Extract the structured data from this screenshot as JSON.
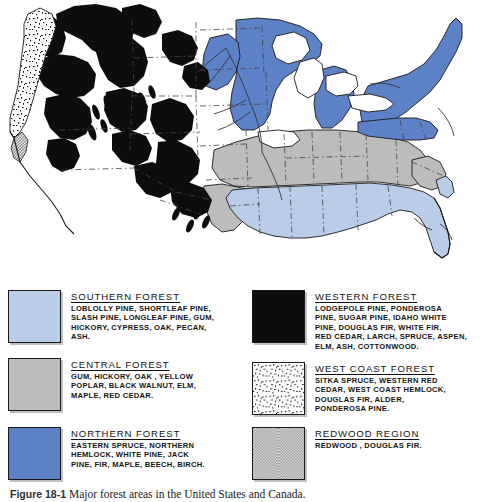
{
  "figure": {
    "caption_label": "Figure 18-1",
    "caption_text": "Major forest areas in the United States and Canada.",
    "alt_title": "Major forest areas in the United States and Canada"
  },
  "colors": {
    "southern_forest": "#b9cde9",
    "central_forest": "#bcbcbc",
    "northern_forest": "#5d81c6",
    "western_forest": "#0d0d0d",
    "west_coast_forest": "#ffffff",
    "redwood_region": "#c2c2c2",
    "outline": "#1a1a1a",
    "background": "#ffffff"
  },
  "legend": {
    "left_column": [
      {
        "key": "southern-forest",
        "title": "SOUTHERN FOREST",
        "swatch": "light-blue-solid",
        "species_lines": [
          "LOBLOLLY PINE, SHORTLEAF PINE,",
          "SLASH PINE, LONGLEAF PINE, GUM,",
          "HICKORY, CYPRESS, OAK, PECAN,",
          "ASH."
        ]
      },
      {
        "key": "central-forest",
        "title": "CENTRAL FOREST",
        "swatch": "gray-solid",
        "species_lines": [
          "GUM, HICKORY, OAK , YELLOW",
          "POPLAR, BLACK WALNUT, ELM,",
          "MAPLE, RED CEDAR."
        ]
      },
      {
        "key": "northern-forest",
        "title": "NORTHERN FOREST",
        "swatch": "medium-blue-solid",
        "species_lines": [
          "EASTERN SPRUCE, NORTHERN",
          "HEMLOCK, WHITE PINE, JACK",
          "PINE, FIR, MAPLE, BEECH, BIRCH."
        ]
      }
    ],
    "right_column": [
      {
        "key": "western-forest",
        "title": "WESTERN FOREST",
        "swatch": "black-solid",
        "species_lines": [
          "LODGEPOLE PINE, PONDEROSA",
          "PINE, SUGAR PINE, IDAHO WHITE",
          "PINE, DOUGLAS FIR, WHITE FIR,",
          "RED CEDAR, LARCH, SPRUCE, ASPEN,",
          "ELM, ASH, COTTONWOOD."
        ]
      },
      {
        "key": "west-coast-forest",
        "title": "WEST COAST FOREST",
        "swatch": "stipple-speckle",
        "species_lines": [
          "SITKA SPRUCE, WESTERN RED",
          "CEDAR, WEST COAST HEMLOCK,",
          "DOUGLAS FIR, ALDER,",
          "PONDEROSA PINE."
        ]
      },
      {
        "key": "redwood-region",
        "title": "REDWOOD REGION",
        "swatch": "gray-halftone",
        "species_lines": [
          "REDWOOD , DOUGLAS FIR."
        ]
      }
    ]
  },
  "map": {
    "region_name": "United States and Canada",
    "regions_shown": [
      "Southern Forest",
      "Central Forest",
      "Northern Forest",
      "Western Forest",
      "West Coast Forest",
      "Redwood Region"
    ]
  }
}
